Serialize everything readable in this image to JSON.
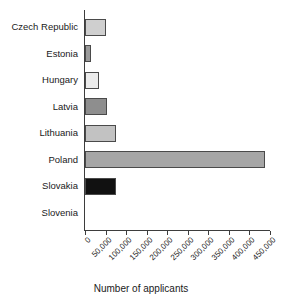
{
  "chart_data": {
    "type": "bar",
    "orientation": "horizontal",
    "title": "",
    "xlabel": "Number of applicants",
    "ylabel": "",
    "xlim": [
      0,
      450000
    ],
    "grid": false,
    "legend": "none",
    "categories": [
      "Czech Republic",
      "Estonia",
      "Hungary",
      "Latvia",
      "Lithuania",
      "Poland",
      "Slovakia",
      "Slovenia"
    ],
    "values": [
      51000,
      15000,
      34000,
      54000,
      76000,
      438000,
      76000,
      0
    ],
    "xticks": [
      0,
      50000,
      100000,
      150000,
      200000,
      250000,
      300000,
      350000,
      400000,
      450000
    ],
    "xtick_labels": [
      "0",
      "50,000",
      "100,000",
      "150,000",
      "200,000",
      "250,000",
      "300,000",
      "350,000",
      "400,000",
      "450,000"
    ],
    "bar_colors": [
      "#cfcfcf",
      "#9a9a9a",
      "#ececec",
      "#8e8e8e",
      "#c2c2c2",
      "#a6a6a6",
      "#111111",
      "#ffffff"
    ],
    "bar_edge_color": "#4a4a4a",
    "axis_color": "#3d3d3d"
  }
}
